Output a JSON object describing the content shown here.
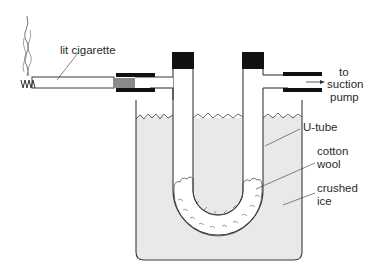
{
  "diagram": {
    "labels": {
      "cigarette": "lit cigarette",
      "pump_line1": "to",
      "pump_line2": "suction",
      "pump_line3": "pump",
      "utube": "U-tube",
      "cotton_line1": "cotton",
      "cotton_line2": "wool",
      "ice_line1": "crushed",
      "ice_line2": "ice"
    },
    "colors": {
      "ice": "#e9e9e9",
      "outline": "#3a3a3a",
      "stopper": "#111111",
      "filter": "#8a8a8a",
      "cotton": "#ffffff"
    }
  }
}
